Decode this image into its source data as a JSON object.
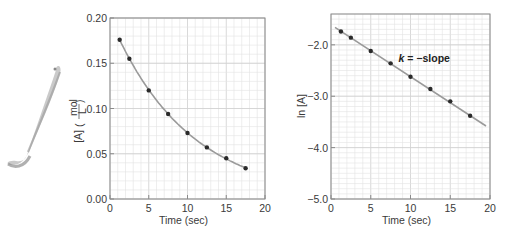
{
  "colors": {
    "frame": "#8a8a8a",
    "grid": "#e2e2e2",
    "fit_line": "#9a9a9a",
    "points": "#2a2a2a",
    "text": "#3a3a3a",
    "swoosh": "#b0b0b0"
  },
  "decoration": {
    "name": "gray-brush-swoosh"
  },
  "chart_data": [
    {
      "type": "scatter",
      "title": "",
      "xlabel": "Time (sec)",
      "ylabel": "[A] (mol/L)",
      "ylabel_parts": {
        "main": "[A]",
        "num": "mol",
        "den": "L"
      },
      "xlim": [
        0,
        20
      ],
      "ylim": [
        0.0,
        0.2
      ],
      "xticks": [
        0,
        5,
        10,
        15,
        20
      ],
      "xtick_labels": [
        "0",
        "5",
        "10",
        "15",
        "20"
      ],
      "yticks": [
        0.0,
        0.05,
        0.1,
        0.15,
        0.2
      ],
      "ytick_labels": [
        "0.00",
        "0.05",
        "0.10",
        "0.15",
        "0.20"
      ],
      "grid": true,
      "legend": null,
      "series": [
        {
          "name": "[A] vs time",
          "x": [
            1.25,
            2.5,
            5,
            7.5,
            10,
            12.5,
            15,
            17.5
          ],
          "y": [
            0.176,
            0.155,
            0.12,
            0.094,
            0.073,
            0.057,
            0.045,
            0.034
          ],
          "fit": "exponential decay curve"
        }
      ],
      "annotations": []
    },
    {
      "type": "scatter",
      "title": "",
      "xlabel": "Time (sec)",
      "ylabel": "ln [A]",
      "xlim": [
        0,
        20
      ],
      "ylim": [
        -5.0,
        -1.4
      ],
      "xticks": [
        0,
        5,
        10,
        15,
        20
      ],
      "xtick_labels": [
        "0",
        "5",
        "10",
        "15",
        "20"
      ],
      "yticks": [
        -5.0,
        -4.0,
        -3.0,
        -2.0
      ],
      "ytick_labels": [
        "−5.0",
        "−4.0",
        "−3.0",
        "−2.0"
      ],
      "grid": true,
      "legend": null,
      "series": [
        {
          "name": "ln [A] vs time",
          "x": [
            1.25,
            2.5,
            5,
            7.5,
            10,
            12.5,
            15,
            17.5
          ],
          "y": [
            -1.74,
            -1.86,
            -2.12,
            -2.36,
            -2.62,
            -2.86,
            -3.1,
            -3.38
          ],
          "fit": "linear",
          "fit_line": {
            "x": [
              0.5,
              19.5
            ],
            "y": [
              -1.66,
              -3.58
            ]
          }
        }
      ],
      "annotations": [
        {
          "text_italic": "k",
          "text_rest": " = −slope",
          "x": 8.5,
          "y": -2.25
        }
      ]
    }
  ]
}
